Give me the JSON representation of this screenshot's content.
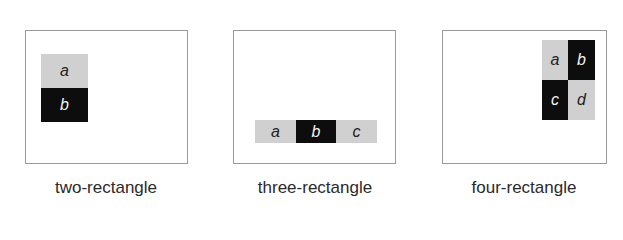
{
  "panels": [
    {
      "caption": "two-rectangle",
      "cells": [
        {
          "label": "a",
          "shade": "light"
        },
        {
          "label": "b",
          "shade": "dark"
        }
      ]
    },
    {
      "caption": "three-rectangle",
      "cells": [
        {
          "label": "a",
          "shade": "light"
        },
        {
          "label": "b",
          "shade": "dark"
        },
        {
          "label": "c",
          "shade": "light"
        }
      ]
    },
    {
      "caption": "four-rectangle",
      "cells": [
        {
          "label": "a",
          "shade": "light"
        },
        {
          "label": "b",
          "shade": "dark"
        },
        {
          "label": "c",
          "shade": "dark"
        },
        {
          "label": "d",
          "shade": "light"
        }
      ]
    }
  ],
  "colors": {
    "light": "#d0d0d0",
    "dark": "#0d0d0d",
    "frame": "#9a9a9a"
  }
}
